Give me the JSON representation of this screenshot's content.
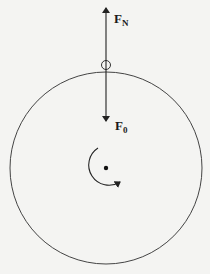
{
  "diagram": {
    "type": "free-body diagram of rotating disk",
    "colors": {
      "background": "#f4f4f2",
      "stroke": "#333333",
      "text": "#1a1a1a"
    },
    "disk": {
      "cx": 106,
      "cy": 168,
      "r": 96
    },
    "contact_point": {
      "cx": 106,
      "cy": 65,
      "r": 4.5
    },
    "forces": [
      {
        "name": "normal-force",
        "label_main": "F",
        "label_sub": "N",
        "direction": "up",
        "from": [
          106,
          65
        ],
        "to": [
          106,
          7
        ]
      },
      {
        "name": "applied-force",
        "label_main": "F",
        "label_sub": "0",
        "direction": "down",
        "from": [
          106,
          65
        ],
        "to": [
          106,
          122
        ]
      }
    ],
    "rotation": {
      "direction": "clockwise",
      "center": [
        106,
        168
      ]
    }
  }
}
